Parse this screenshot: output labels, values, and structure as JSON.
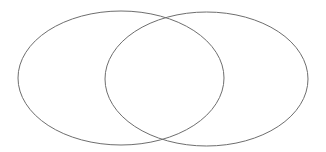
{
  "diagram": {
    "type": "venn",
    "background": "#ffffff",
    "stroke_color": "#6e6e6e",
    "stroke_width": 1,
    "sets": [
      {
        "id": "left-set",
        "label": "",
        "cx": 121,
        "cy": 78,
        "rx": 103,
        "ry": 67
      },
      {
        "id": "right-set",
        "label": "",
        "cx": 206.5,
        "cy": 79,
        "rx": 101.5,
        "ry": 67
      }
    ]
  }
}
